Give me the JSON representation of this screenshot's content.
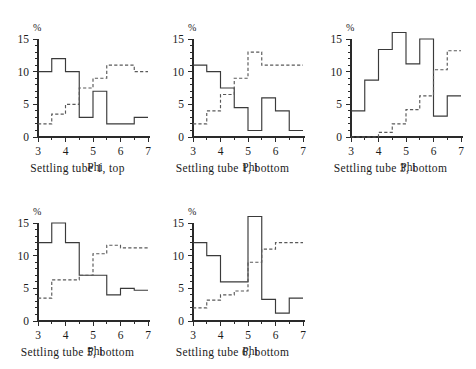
{
  "figure": {
    "y_unit_label": "%",
    "x_axis_title": "Phi",
    "y_ticks": [
      0,
      5,
      10,
      15
    ],
    "x_ticks": [
      3,
      4,
      5,
      6,
      7
    ],
    "x_minor_step": 0.5,
    "axis_color": "#2a2a2a",
    "solid_series_color": "#3a3a3a",
    "dashed_series_color": "#595959"
  },
  "chart_data": [
    {
      "type": "line",
      "title": "Settling tube 1, top",
      "xlabel": "Phi",
      "ylabel": "%",
      "xlim": [
        3,
        7
      ],
      "ylim": [
        0,
        15
      ],
      "grid": false,
      "legend": "none",
      "bin_edges": [
        3,
        3.5,
        4,
        4.5,
        5,
        5.5,
        6,
        6.5,
        7
      ],
      "series": [
        {
          "name": "solid",
          "style": "solid",
          "values": [
            10,
            12,
            10,
            3,
            7,
            2,
            2,
            3
          ]
        },
        {
          "name": "dashed",
          "style": "dashed",
          "values": [
            2,
            3.5,
            5,
            7.5,
            9,
            11,
            11,
            10
          ]
        }
      ]
    },
    {
      "type": "line",
      "title": "Settling tube 1, bottom",
      "xlabel": "Phi",
      "ylabel": "%",
      "xlim": [
        3,
        7
      ],
      "ylim": [
        0,
        15
      ],
      "grid": false,
      "legend": "none",
      "bin_edges": [
        3,
        3.5,
        4,
        4.5,
        5,
        5.5,
        6,
        6.5,
        7
      ],
      "series": [
        {
          "name": "solid",
          "style": "solid",
          "values": [
            11,
            10,
            7.5,
            4.5,
            1,
            6,
            4,
            1
          ]
        },
        {
          "name": "dashed",
          "style": "dashed",
          "values": [
            2,
            4,
            6.5,
            9,
            13,
            11,
            11,
            11
          ]
        }
      ]
    },
    {
      "type": "line",
      "title": "Settling tube 3, bottom",
      "xlabel": "Phi",
      "ylabel": "%",
      "xlim": [
        3,
        7
      ],
      "ylim": [
        0,
        15
      ],
      "grid": false,
      "legend": "none",
      "bin_edges": [
        3,
        3.5,
        4,
        4.5,
        5,
        5.5,
        6,
        6.5,
        7
      ],
      "series": [
        {
          "name": "solid",
          "style": "solid",
          "values": [
            4,
            8.7,
            13.4,
            16,
            11.2,
            15,
            3.2,
            6.3
          ]
        },
        {
          "name": "dashed",
          "style": "dashed",
          "values": [
            0,
            0,
            0.7,
            2,
            4.2,
            6.3,
            10.3,
            13.2
          ]
        }
      ]
    },
    {
      "type": "line",
      "title": "Settling tube 5, bottom",
      "xlabel": "Phi",
      "ylabel": "%",
      "xlim": [
        3,
        7
      ],
      "ylim": [
        0,
        15
      ],
      "grid": false,
      "legend": "none",
      "bin_edges": [
        3,
        3.5,
        4,
        4.5,
        5,
        5.5,
        6,
        6.5,
        7
      ],
      "series": [
        {
          "name": "solid",
          "style": "solid",
          "values": [
            12,
            15,
            12,
            7,
            7,
            4,
            5,
            4.7
          ]
        },
        {
          "name": "dashed",
          "style": "dashed",
          "values": [
            3.5,
            6.3,
            6.3,
            7,
            10.3,
            11.6,
            11.2,
            11.2
          ]
        }
      ]
    },
    {
      "type": "line",
      "title": "Settling tube 6, bottom",
      "xlabel": "Phi",
      "ylabel": "%",
      "xlim": [
        3,
        7
      ],
      "ylim": [
        0,
        15
      ],
      "grid": false,
      "legend": "none",
      "bin_edges": [
        3,
        3.5,
        4,
        4.5,
        5,
        5.5,
        6,
        6.5,
        7
      ],
      "series": [
        {
          "name": "solid",
          "style": "solid",
          "values": [
            12,
            10,
            6,
            6,
            16,
            3.3,
            1.2,
            3.5
          ]
        },
        {
          "name": "dashed",
          "style": "dashed",
          "values": [
            2,
            3.2,
            4,
            4.6,
            9,
            11,
            12,
            12
          ]
        }
      ]
    }
  ]
}
